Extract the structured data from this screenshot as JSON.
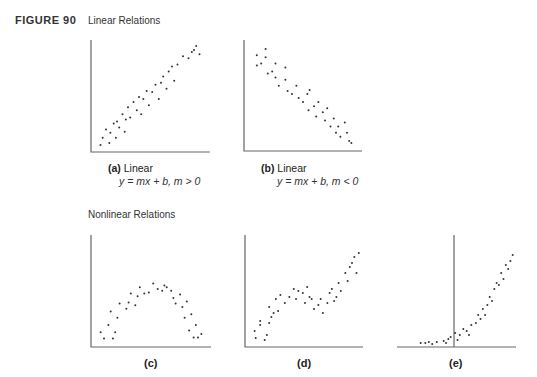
{
  "figure": {
    "label": "FIGURE 90",
    "linear_title": "Linear Relations",
    "nonlinear_title": "Nonlinear Relations"
  },
  "captions": {
    "a": {
      "tag": "(a)",
      "text": "Linear",
      "equation": "y = mx + b, m > 0"
    },
    "b": {
      "tag": "(b)",
      "text": "Linear",
      "equation": "y = mx + b, m < 0"
    },
    "c": {
      "tag": "(c)"
    },
    "d": {
      "tag": "(d)"
    },
    "e": {
      "tag": "(e)"
    }
  },
  "chart_data": [
    {
      "id": "a",
      "type": "scatter",
      "title": "Linear, positive slope",
      "relation": "y = mx + b, m > 0",
      "points": [
        [
          5,
          3
        ],
        [
          7,
          10
        ],
        [
          10,
          18
        ],
        [
          13,
          5
        ],
        [
          14,
          15
        ],
        [
          17,
          24
        ],
        [
          19,
          10
        ],
        [
          20,
          26
        ],
        [
          22,
          20
        ],
        [
          25,
          33
        ],
        [
          27,
          16
        ],
        [
          28,
          28
        ],
        [
          30,
          40
        ],
        [
          32,
          30
        ],
        [
          35,
          45
        ],
        [
          38,
          37
        ],
        [
          40,
          50
        ],
        [
          42,
          33
        ],
        [
          44,
          48
        ],
        [
          47,
          56
        ],
        [
          49,
          42
        ],
        [
          52,
          55
        ],
        [
          55,
          62
        ],
        [
          58,
          48
        ],
        [
          60,
          64
        ],
        [
          62,
          70
        ],
        [
          65,
          58
        ],
        [
          67,
          75
        ],
        [
          70,
          80
        ],
        [
          72,
          66
        ],
        [
          75,
          82
        ],
        [
          80,
          90
        ],
        [
          85,
          88
        ],
        [
          88,
          94
        ],
        [
          90,
          96
        ],
        [
          92,
          100
        ],
        [
          95,
          92
        ]
      ]
    },
    {
      "id": "b",
      "type": "scatter",
      "title": "Linear, negative slope",
      "relation": "y = mx + b, m < 0",
      "points": [
        [
          8,
          90
        ],
        [
          8,
          80
        ],
        [
          12,
          82
        ],
        [
          16,
          96
        ],
        [
          16,
          88
        ],
        [
          18,
          72
        ],
        [
          22,
          74
        ],
        [
          25,
          82
        ],
        [
          25,
          68
        ],
        [
          28,
          60
        ],
        [
          34,
          78
        ],
        [
          34,
          66
        ],
        [
          36,
          55
        ],
        [
          40,
          52
        ],
        [
          44,
          60
        ],
        [
          46,
          48
        ],
        [
          50,
          44
        ],
        [
          54,
          52
        ],
        [
          55,
          36
        ],
        [
          56,
          56
        ],
        [
          60,
          40
        ],
        [
          62,
          30
        ],
        [
          64,
          44
        ],
        [
          68,
          34
        ],
        [
          70,
          26
        ],
        [
          72,
          38
        ],
        [
          75,
          20
        ],
        [
          78,
          28
        ],
        [
          80,
          14
        ],
        [
          82,
          20
        ],
        [
          84,
          10
        ],
        [
          88,
          24
        ],
        [
          90,
          14
        ],
        [
          92,
          6
        ],
        [
          94,
          4
        ]
      ]
    },
    {
      "id": "c",
      "type": "scatter",
      "title": "Nonlinear (inverted U)",
      "points": [
        [
          5,
          12
        ],
        [
          8,
          5
        ],
        [
          12,
          20
        ],
        [
          14,
          35
        ],
        [
          16,
          5
        ],
        [
          18,
          12
        ],
        [
          20,
          28
        ],
        [
          22,
          44
        ],
        [
          28,
          38
        ],
        [
          30,
          45
        ],
        [
          32,
          55
        ],
        [
          36,
          42
        ],
        [
          38,
          52
        ],
        [
          40,
          62
        ],
        [
          44,
          55
        ],
        [
          48,
          56
        ],
        [
          52,
          66
        ],
        [
          56,
          60
        ],
        [
          60,
          58
        ],
        [
          62,
          64
        ],
        [
          64,
          62
        ],
        [
          68,
          58
        ],
        [
          70,
          50
        ],
        [
          72,
          44
        ],
        [
          76,
          54
        ],
        [
          78,
          40
        ],
        [
          80,
          28
        ],
        [
          82,
          46
        ],
        [
          84,
          14
        ],
        [
          86,
          32
        ],
        [
          88,
          6
        ],
        [
          90,
          20
        ],
        [
          92,
          6
        ],
        [
          95,
          10
        ]
      ]
    },
    {
      "id": "d",
      "type": "scatter",
      "title": "Nonlinear (cubic-like)",
      "points": [
        [
          5,
          12
        ],
        [
          6,
          5
        ],
        [
          10,
          18
        ],
        [
          10,
          22
        ],
        [
          14,
          3
        ],
        [
          16,
          8
        ],
        [
          18,
          20
        ],
        [
          18,
          36
        ],
        [
          20,
          26
        ],
        [
          22,
          30
        ],
        [
          24,
          44
        ],
        [
          26,
          32
        ],
        [
          28,
          48
        ],
        [
          32,
          40
        ],
        [
          36,
          46
        ],
        [
          40,
          54
        ],
        [
          42,
          44
        ],
        [
          44,
          52
        ],
        [
          48,
          50
        ],
        [
          50,
          40
        ],
        [
          52,
          56
        ],
        [
          54,
          46
        ],
        [
          56,
          44
        ],
        [
          58,
          34
        ],
        [
          62,
          38
        ],
        [
          64,
          44
        ],
        [
          66,
          30
        ],
        [
          70,
          40
        ],
        [
          72,
          50
        ],
        [
          74,
          54
        ],
        [
          76,
          42
        ],
        [
          78,
          46
        ],
        [
          80,
          60
        ],
        [
          82,
          52
        ],
        [
          86,
          70
        ],
        [
          88,
          62
        ],
        [
          90,
          76
        ],
        [
          92,
          80
        ],
        [
          94,
          86
        ],
        [
          96,
          70
        ],
        [
          98,
          90
        ]
      ]
    },
    {
      "id": "e",
      "type": "scatter",
      "title": "Nonlinear (exponential-like)",
      "points": [
        [
          18,
          2
        ],
        [
          22,
          2
        ],
        [
          25,
          3
        ],
        [
          28,
          1
        ],
        [
          32,
          3
        ],
        [
          38,
          4
        ],
        [
          40,
          2
        ],
        [
          42,
          6
        ],
        [
          44,
          8
        ],
        [
          48,
          12
        ],
        [
          50,
          5
        ],
        [
          52,
          10
        ],
        [
          55,
          16
        ],
        [
          58,
          14
        ],
        [
          60,
          10
        ],
        [
          62,
          20
        ],
        [
          66,
          22
        ],
        [
          68,
          30
        ],
        [
          70,
          26
        ],
        [
          72,
          36
        ],
        [
          74,
          30
        ],
        [
          76,
          40
        ],
        [
          78,
          48
        ],
        [
          80,
          44
        ],
        [
          82,
          56
        ],
        [
          84,
          62
        ],
        [
          86,
          60
        ],
        [
          88,
          72
        ],
        [
          90,
          66
        ],
        [
          92,
          80
        ],
        [
          94,
          76
        ],
        [
          96,
          84
        ],
        [
          98,
          90
        ]
      ]
    }
  ]
}
